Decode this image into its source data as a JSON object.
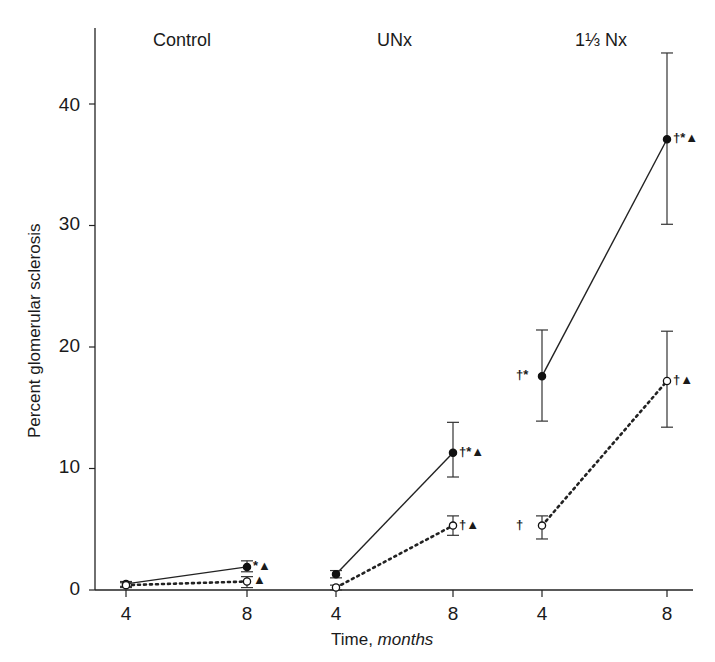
{
  "chart_data": {
    "type": "line",
    "title": "",
    "xlabel": "Time, months",
    "xlabel_parts": {
      "plain": "Time, ",
      "italic": "months"
    },
    "ylabel": "Percent glomerular sclerosis",
    "ylim": [
      0,
      45
    ],
    "yticks": [
      0,
      10,
      20,
      30,
      40
    ],
    "grid": false,
    "legend": "none",
    "groups": [
      {
        "name": "Control",
        "x": [
          4,
          8
        ]
      },
      {
        "name": "UNx",
        "x": [
          4,
          8
        ]
      },
      {
        "name": "1⅓ Nx",
        "x": [
          4,
          8
        ]
      }
    ],
    "categories": [
      "Control 4",
      "Control 8",
      "UNx 4",
      "UNx 8",
      "1⅓ Nx 4",
      "1⅓ Nx 8"
    ],
    "xtick_labels": [
      "4",
      "8",
      "4",
      "8",
      "4",
      "8"
    ],
    "series": [
      {
        "name": "filled circles (solid line)",
        "marker": "filled-circle",
        "line": "solid",
        "values": [
          0.5,
          1.9,
          1.3,
          11.3,
          17.6,
          37.1
        ],
        "error_low": [
          0.3,
          1.5,
          1.0,
          9.3,
          13.9,
          30.1
        ],
        "error_high": [
          0.7,
          2.4,
          1.6,
          13.8,
          21.4,
          44.2
        ],
        "annotations": [
          "",
          "*▲",
          "",
          "†*▲",
          "†*",
          "†*▲"
        ],
        "annotation_side": [
          "",
          "right",
          "",
          "right",
          "left",
          "right"
        ]
      },
      {
        "name": "open circles (dotted line)",
        "marker": "open-circle",
        "line": "dotted",
        "values": [
          0.4,
          0.7,
          0.2,
          5.3,
          5.3,
          17.2
        ],
        "error_low": [
          0.2,
          0.2,
          0.0,
          4.5,
          4.2,
          13.4
        ],
        "error_high": [
          0.6,
          1.1,
          0.4,
          6.1,
          6.1,
          21.3
        ],
        "annotations": [
          "",
          "▲",
          "",
          "†▲",
          "†",
          "†▲"
        ],
        "annotation_side": [
          "",
          "right",
          "",
          "right",
          "left",
          "right"
        ]
      }
    ]
  }
}
